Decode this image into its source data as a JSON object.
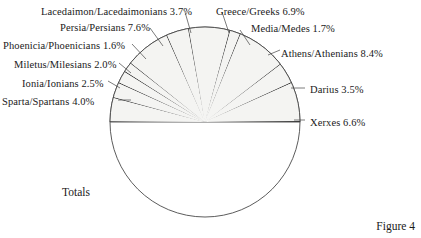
{
  "figure": {
    "caption": "Figure 4",
    "totals_label": "Totals"
  },
  "chart_data": {
    "type": "pie",
    "title": "",
    "subtitle": "",
    "xlabel": "",
    "ylabel": "",
    "legend_position": "callout-labels",
    "grid": false,
    "units": "percent",
    "center": {
      "x": 205,
      "y": 122
    },
    "radius": 95,
    "start_angle_deg": 180,
    "direction": "counterclockwise",
    "colors": {
      "slice_fill": "#f4f4f2",
      "filler_fill": "#0d0d0d",
      "totals_fill": "#ffffff",
      "outline": "#4a4a4a",
      "leader_line": "#5a5a5a",
      "text": "#1a1a1a",
      "background": "#ffffff"
    },
    "categories": [
      "Sparta/Spartans",
      "Ionia/Ionians",
      "Miletus/Milesians",
      "Phoenicia/Phoenicians",
      "Persia/Persians",
      "Lacedaimon/Lacedaimonians",
      "Greece/Greeks",
      "Media/Medes",
      "Athens/Athenians",
      "Darius",
      "Xerxes",
      "Totals"
    ],
    "values": [
      4.0,
      2.5,
      2.0,
      1.6,
      7.6,
      3.7,
      6.9,
      1.7,
      8.4,
      3.5,
      6.6,
      50.0
    ],
    "labels": [
      "Sparta/Spartans 4.0%",
      "Ionia/Ionians 2.5%",
      "Miletus/Milesians 2.0%",
      "Phoenicia/Phoenicians 1.6%",
      "Persia/Persians 7.6%",
      "Lacedaimon/Lacedaimonians 3.7%",
      "Greece/Greeks 6.9%",
      "Media/Medes 1.7%",
      "Athens/Athenians 8.4%",
      "Darius 3.5%",
      "Xerxes 6.6%"
    ],
    "slices": [
      {
        "name": "sparta",
        "label": "Sparta/Spartans 4.0%",
        "value": 4.0,
        "side": "left",
        "label_x": 2,
        "label_y": 96
      },
      {
        "name": "ionia",
        "label": "Ionia/Ionians 2.5%",
        "value": 2.5,
        "side": "left",
        "label_x": 22,
        "label_y": 78
      },
      {
        "name": "miletus",
        "label": "Miletus/Milesians 2.0%",
        "value": 2.0,
        "side": "left",
        "label_x": 14,
        "label_y": 59
      },
      {
        "name": "phoenicia",
        "label": "Phoenicia/Phoenicians 1.6%",
        "value": 1.6,
        "side": "left",
        "label_x": 3,
        "label_y": 40
      },
      {
        "name": "persia",
        "label": "Persia/Persians 7.6%",
        "value": 7.6,
        "side": "left",
        "label_x": 60,
        "label_y": 22
      },
      {
        "name": "lacedaimon",
        "label": "Lacedaimon/Lacedaimonians 3.7%",
        "value": 3.7,
        "side": "left",
        "label_x": 41,
        "label_y": 6
      },
      {
        "name": "greece",
        "label": "Greece/Greeks 6.9%",
        "value": 6.9,
        "side": "right",
        "label_x": 216,
        "label_y": 6
      },
      {
        "name": "media",
        "label": "Media/Medes 1.7%",
        "value": 1.7,
        "side": "right",
        "label_x": 251,
        "label_y": 23
      },
      {
        "name": "athens",
        "label": "Athens/Athenians 8.4%",
        "value": 8.4,
        "side": "right",
        "label_x": 281,
        "label_y": 48
      },
      {
        "name": "darius",
        "label": "Darius 3.5%",
        "value": 3.5,
        "side": "right",
        "label_x": 310,
        "label_y": 84
      },
      {
        "name": "xerxes",
        "label": "Xerxes 6.6%",
        "value": 6.6,
        "side": "right",
        "label_x": 310,
        "label_y": 117
      }
    ],
    "leaders": [
      {
        "name": "sparta",
        "x1": 118,
        "y1": 100,
        "x2": 131,
        "y2": 100
      },
      {
        "name": "ionia",
        "x1": 108,
        "y1": 81,
        "x2": 120,
        "y2": 88
      },
      {
        "name": "miletus",
        "x1": 119,
        "y1": 63,
        "x2": 131,
        "y2": 73
      },
      {
        "name": "phoenicia",
        "x1": 132,
        "y1": 44,
        "x2": 146,
        "y2": 59
      },
      {
        "name": "persia",
        "x1": 150,
        "y1": 28,
        "x2": 163,
        "y2": 46
      },
      {
        "name": "lacedaimon",
        "x1": 185,
        "y1": 12,
        "x2": 191,
        "y2": 33
      },
      {
        "name": "greece",
        "x1": 222,
        "y1": 12,
        "x2": 229,
        "y2": 33
      },
      {
        "name": "media",
        "x1": 240,
        "y1": 30,
        "x2": 250,
        "y2": 45
      },
      {
        "name": "athens",
        "x1": 268,
        "y1": 55,
        "x2": 280,
        "y2": 50
      },
      {
        "name": "darius",
        "x1": 291,
        "y1": 88,
        "x2": 305,
        "y2": 88
      },
      {
        "name": "xerxes",
        "x1": 294,
        "y1": 120,
        "x2": 305,
        "y2": 120
      }
    ]
  }
}
